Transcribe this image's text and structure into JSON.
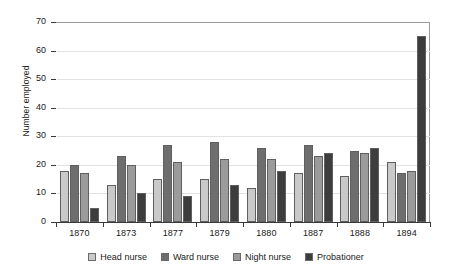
{
  "chart_data": {
    "type": "bar",
    "title": "",
    "xlabel": "",
    "ylabel": "Number employed",
    "ylim": [
      0,
      70
    ],
    "yticks": [
      0,
      10,
      20,
      30,
      40,
      50,
      60,
      70
    ],
    "grid": true,
    "legend_position": "bottom",
    "categories": [
      "1870",
      "1873",
      "1877",
      "1879",
      "1880",
      "1887",
      "1888",
      "1894"
    ],
    "series": [
      {
        "name": "Head nurse",
        "color": "#c9c9c9",
        "values": [
          18,
          13,
          15,
          15,
          12,
          17,
          16,
          21
        ]
      },
      {
        "name": "Ward nurse",
        "color": "#6e6e6e",
        "values": [
          20,
          23,
          27,
          28,
          26,
          27,
          25,
          17
        ]
      },
      {
        "name": "Night nurse",
        "color": "#9b9b9b",
        "values": [
          17,
          20,
          21,
          22,
          22,
          23,
          24,
          18
        ]
      },
      {
        "name": "Probationer",
        "color": "#3d3d3d",
        "values": [
          5,
          10,
          9,
          13,
          18,
          24,
          26,
          65
        ]
      }
    ]
  }
}
